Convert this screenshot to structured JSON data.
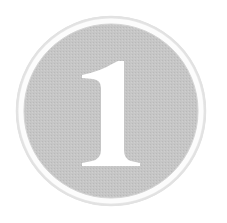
{
  "badge": {
    "number": "1",
    "icon": "number-one-badge-icon",
    "colors": {
      "background": "#ffffff",
      "outer_ring_edge": "#d9d9d9",
      "ring_white": "#fbfbfb",
      "fill": "#c4c4c4",
      "fill_dot": "#b8b8b8",
      "digit": "#ffffff"
    }
  }
}
